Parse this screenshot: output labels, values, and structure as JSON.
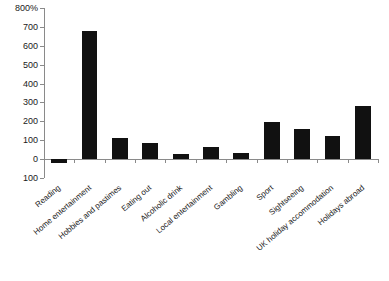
{
  "chart_data": {
    "type": "bar",
    "title": "",
    "subtitle": "",
    "xlabel": "",
    "ylabel": "",
    "categories": [
      "Reading",
      "Home entertainment",
      "Hobbies and pastimes",
      "Eating out",
      "Alcoholic drink",
      "Local entertainment",
      "Gambling",
      "Sport",
      "Sightseeing",
      "UK holiday accommodation",
      "Holidays abroad"
    ],
    "values": [
      -20,
      680,
      110,
      85,
      25,
      65,
      35,
      195,
      160,
      125,
      280
    ],
    "ylim": [
      -100,
      800
    ],
    "ytick_values": [
      800,
      700,
      600,
      500,
      400,
      300,
      200,
      100,
      0,
      -100
    ],
    "ytick_labels": [
      "800%",
      "700",
      "600",
      "500",
      "400",
      "300",
      "200",
      "100",
      "0",
      "100"
    ],
    "grid": false,
    "legend": null,
    "bar_color": "#111111",
    "axis_color": "#8a8a8a"
  },
  "footer": {
    "note": ""
  }
}
